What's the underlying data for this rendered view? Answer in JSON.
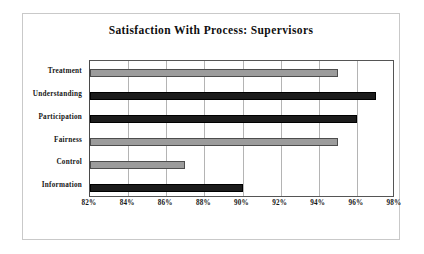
{
  "chart_data": {
    "type": "bar",
    "orientation": "horizontal",
    "title": "Satisfaction With Process: Supervisors",
    "xlabel": "",
    "ylabel": "",
    "categories": [
      "Treatment",
      "Understanding",
      "Participation",
      "Fairness",
      "Control",
      "Information"
    ],
    "values": [
      95,
      97,
      96,
      95,
      87,
      90
    ],
    "bar_styles": [
      "light",
      "dark",
      "dark",
      "light",
      "light",
      "dark"
    ],
    "xlim": [
      82,
      98
    ],
    "xticks": [
      82,
      84,
      86,
      88,
      90,
      92,
      94,
      96,
      98
    ],
    "xtick_labels": [
      "82%",
      "84%",
      "86%",
      "88%",
      "90%",
      "92%",
      "94%",
      "96%",
      "98%"
    ],
    "grid": true,
    "grid_axis": "x",
    "legend": false,
    "legend_position": "none",
    "colors": {
      "light_bar": "#9c9c9c",
      "dark_bar": "#1c1c1c",
      "gridline": "#b4b4b4",
      "axis": "#555555",
      "frame": "#c9c9c9",
      "background": "#ffffff",
      "text": "#161616"
    }
  }
}
